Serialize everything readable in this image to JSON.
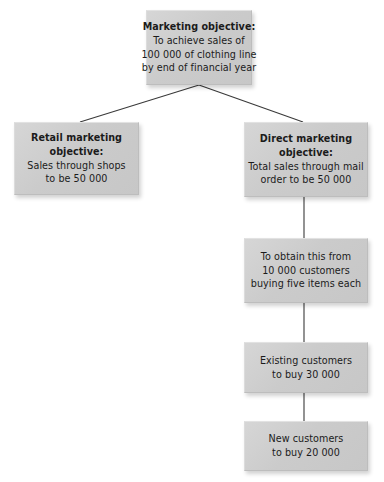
{
  "diagram": {
    "type": "hierarchy-tree",
    "box_fill_color": "#cccccc",
    "connector_color": "#3a3a3a",
    "background_color": "#ffffff",
    "nodes": [
      {
        "id": "marketing-objective",
        "lines": [
          {
            "text": "Marketing objective:",
            "bold": true
          },
          {
            "text": "To achieve sales of",
            "bold": false
          },
          {
            "text": "100 000 of clothing line",
            "bold": false
          },
          {
            "text": "by end of financial year",
            "bold": false
          }
        ]
      },
      {
        "id": "retail-objective",
        "lines": [
          {
            "text": "Retail marketing",
            "bold": true
          },
          {
            "text": "objective:",
            "bold": true
          },
          {
            "text": "Sales through shops",
            "bold": false
          },
          {
            "text": "to be 50 000",
            "bold": false
          }
        ]
      },
      {
        "id": "direct-objective",
        "lines": [
          {
            "text": "Direct marketing",
            "bold": true
          },
          {
            "text": "objective:",
            "bold": true
          },
          {
            "text": "Total sales through mail",
            "bold": false
          },
          {
            "text": "order to be 50 000",
            "bold": false
          }
        ]
      },
      {
        "id": "obtain-customers",
        "lines": [
          {
            "text": "To obtain this from",
            "bold": false
          },
          {
            "text": "10 000 customers",
            "bold": false
          },
          {
            "text": "buying five items each",
            "bold": false
          }
        ]
      },
      {
        "id": "existing-customers",
        "lines": [
          {
            "text": "Existing customers",
            "bold": false
          },
          {
            "text": "to buy 30 000",
            "bold": false
          }
        ]
      },
      {
        "id": "new-customers",
        "lines": [
          {
            "text": "New customers",
            "bold": false
          },
          {
            "text": "to buy 20 000",
            "bold": false
          }
        ]
      }
    ],
    "connectors": [
      {
        "id": "marketing-to-retail",
        "from": "marketing-objective",
        "to": "retail-objective"
      },
      {
        "id": "marketing-to-direct",
        "from": "marketing-objective",
        "to": "direct-objective"
      },
      {
        "id": "direct-to-obtain",
        "from": "direct-objective",
        "to": "obtain-customers"
      },
      {
        "id": "obtain-to-existing",
        "from": "obtain-customers",
        "to": "existing-customers"
      },
      {
        "id": "existing-to-new",
        "from": "existing-customers",
        "to": "new-customers"
      }
    ]
  }
}
